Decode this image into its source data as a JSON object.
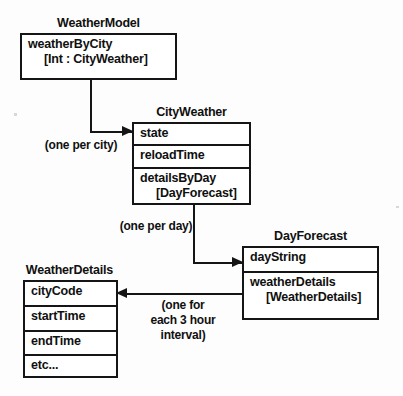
{
  "diagram": {
    "type": "uml-class-diagram",
    "classes": [
      {
        "id": "weather-model",
        "title": "WeatherModel",
        "rows": [
          {
            "name": "weatherByCity",
            "type": "[Int : CityWeather]"
          }
        ]
      },
      {
        "id": "city-weather",
        "title": "CityWeather",
        "rows": [
          {
            "name": "state",
            "type": ""
          },
          {
            "name": "reloadTime",
            "type": ""
          },
          {
            "name": "detailsByDay",
            "type": "[DayForecast]"
          }
        ]
      },
      {
        "id": "day-forecast",
        "title": "DayForecast",
        "rows": [
          {
            "name": "dayString",
            "type": ""
          },
          {
            "name": "weatherDetails",
            "type": "[WeatherDetails]"
          }
        ]
      },
      {
        "id": "weather-details",
        "title": "WeatherDetails",
        "rows": [
          {
            "name": "cityCode",
            "type": ""
          },
          {
            "name": "startTime",
            "type": ""
          },
          {
            "name": "endTime",
            "type": ""
          },
          {
            "name": "etc...",
            "type": ""
          }
        ]
      }
    ],
    "connectors": [
      {
        "id": "model-to-city",
        "from": "weather-model",
        "to": "city-weather",
        "label": "(one per city)"
      },
      {
        "id": "city-to-day",
        "from": "city-weather",
        "to": "day-forecast",
        "label": "(one per day)"
      },
      {
        "id": "day-to-details",
        "from": "day-forecast",
        "to": "weather-details",
        "label_line_1": "(one for",
        "label_line_2": "each 3 hour",
        "label_line_3": "interval)"
      }
    ],
    "colors": {
      "stroke": "#151515",
      "box_fill": "#ffffff",
      "page": "#fdfdfd"
    }
  }
}
